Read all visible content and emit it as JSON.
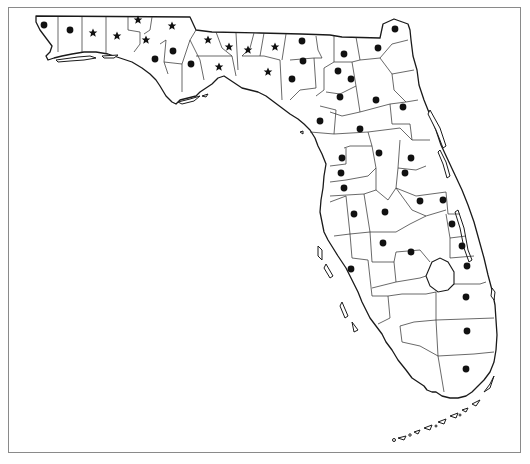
{
  "map": {
    "title": "Florida county distribution map",
    "region": "Florida",
    "legend": {
      "dot": "county record (dot)",
      "star": "county record (star)"
    },
    "colors": {
      "marker": "#111111",
      "outline": "#1a1a1a",
      "frame": "#8a8a8a",
      "background": "#ffffff"
    },
    "dots": [
      [
        44,
        27
      ],
      [
        70,
        32
      ],
      [
        154,
        44
      ],
      [
        175,
        51
      ],
      [
        154,
        59
      ],
      [
        191,
        64
      ],
      [
        211,
        72
      ],
      [
        193,
        94
      ],
      [
        303,
        41
      ],
      [
        302,
        62
      ],
      [
        292,
        79
      ],
      [
        345,
        54
      ],
      [
        396,
        29
      ],
      [
        408,
        48
      ],
      [
        338,
        75
      ],
      [
        352,
        70
      ],
      [
        351,
        80
      ],
      [
        340,
        98
      ],
      [
        375,
        99
      ],
      [
        403,
        108
      ],
      [
        320,
        121
      ],
      [
        357,
        130
      ],
      [
        401,
        133
      ],
      [
        342,
        159
      ],
      [
        362,
        158
      ],
      [
        411,
        157
      ],
      [
        384,
        163
      ],
      [
        409,
        175
      ],
      [
        343,
        173
      ],
      [
        344,
        187
      ],
      [
        353,
        214
      ],
      [
        384,
        212
      ],
      [
        420,
        219
      ],
      [
        437,
        204
      ],
      [
        458,
        222
      ],
      [
        462,
        246
      ],
      [
        466,
        267
      ],
      [
        384,
        243
      ],
      [
        381,
        265
      ],
      [
        458,
        298
      ],
      [
        354,
        249
      ],
      [
        351,
        270
      ],
      [
        467,
        331
      ],
      [
        466,
        369
      ]
    ],
    "stars": [
      [
        44,
        24
      ],
      [
        92,
        35
      ],
      [
        116,
        37
      ],
      [
        138,
        20
      ],
      [
        146,
        39
      ],
      [
        171,
        27
      ],
      [
        207,
        40
      ],
      [
        229,
        47
      ],
      [
        247,
        49
      ],
      [
        273,
        47
      ],
      [
        248,
        51
      ],
      [
        228,
        50
      ],
      [
        218,
        66
      ],
      [
        267,
        72
      ]
    ]
  }
}
